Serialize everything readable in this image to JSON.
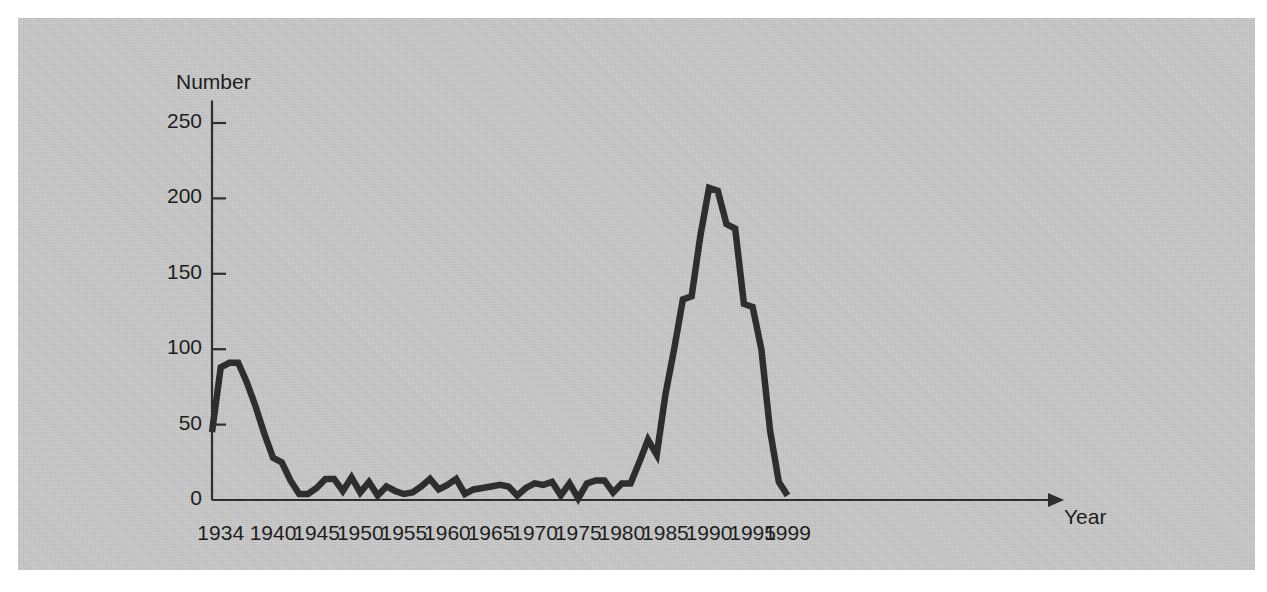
{
  "chart_data": {
    "type": "line",
    "title": "",
    "xlabel": "Year",
    "ylabel": "Number",
    "xlim": [
      1933,
      1999
    ],
    "ylim": [
      0,
      265
    ],
    "grid": false,
    "legend": "none",
    "series_color": "#2b2b2b",
    "x_tick_labels": [
      "1934",
      "1940",
      "1945",
      "1950",
      "1955",
      "1960",
      "1965",
      "1970",
      "1975",
      "1980",
      "1985",
      "1990",
      "1995",
      "1999"
    ],
    "x_tick_values": [
      1934,
      1940,
      1945,
      1950,
      1955,
      1960,
      1965,
      1970,
      1975,
      1980,
      1985,
      1990,
      1995,
      1999
    ],
    "y_tick_labels": [
      "0",
      "50",
      "100",
      "150",
      "200",
      "250"
    ],
    "y_tick_values": [
      0,
      50,
      100,
      150,
      200,
      250
    ],
    "x": [
      1933,
      1934,
      1935,
      1936,
      1937,
      1938,
      1939,
      1940,
      1941,
      1942,
      1943,
      1944,
      1945,
      1946,
      1947,
      1948,
      1949,
      1950,
      1951,
      1952,
      1953,
      1954,
      1955,
      1956,
      1957,
      1958,
      1959,
      1960,
      1961,
      1962,
      1963,
      1964,
      1965,
      1966,
      1967,
      1968,
      1969,
      1970,
      1971,
      1972,
      1973,
      1974,
      1975,
      1976,
      1977,
      1978,
      1979,
      1980,
      1981,
      1982,
      1983,
      1984,
      1985,
      1986,
      1987,
      1988,
      1989,
      1990,
      1991,
      1992,
      1993,
      1994,
      1995,
      1996,
      1997,
      1998,
      1999
    ],
    "values": [
      45,
      88,
      91,
      91,
      78,
      62,
      44,
      28,
      25,
      13,
      4,
      4,
      8,
      14,
      14,
      6,
      15,
      5,
      12,
      3,
      9,
      6,
      4,
      5,
      9,
      14,
      7,
      10,
      14,
      4,
      7,
      8,
      9,
      10,
      9,
      3,
      8,
      11,
      10,
      12,
      3,
      11,
      1,
      11,
      13,
      13,
      5,
      11,
      11,
      25,
      40,
      30,
      70,
      100,
      133,
      135,
      175,
      207,
      205,
      183,
      180,
      130,
      128,
      100,
      46,
      12,
      3
    ],
    "annotations": []
  },
  "axes": {
    "y_axis_title": "Number",
    "x_axis_title": "Year"
  }
}
